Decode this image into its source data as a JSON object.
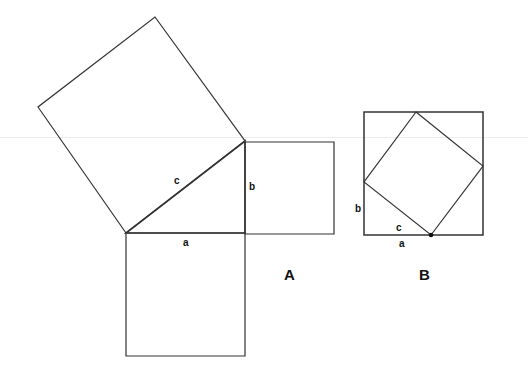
{
  "figure": {
    "panels": [
      {
        "id": "A",
        "label": "A",
        "triangle": {
          "vertices": [
            [
              126,
              233
            ],
            [
              245,
              233
            ],
            [
              245,
              141
            ]
          ]
        },
        "square_c": {
          "vertices": [
            [
              126,
              233
            ],
            [
              38,
              107
            ],
            [
              155,
              17
            ],
            [
              245,
              141
            ]
          ]
        },
        "square_b": {
          "vertices": [
            [
              245,
              142
            ],
            [
              334,
              142
            ],
            [
              334,
              234
            ],
            [
              245,
              234
            ]
          ]
        },
        "square_a": {
          "vertices": [
            [
              126,
              233
            ],
            [
              245,
              233
            ],
            [
              245,
              356
            ],
            [
              126,
              356
            ]
          ]
        },
        "side_labels": {
          "a": "a",
          "b": "b",
          "c": "c"
        }
      },
      {
        "id": "B",
        "label": "B",
        "outer_square": {
          "vertices": [
            [
              364,
              112
            ],
            [
              483,
              112
            ],
            [
              483,
              235
            ],
            [
              364,
              235
            ]
          ]
        },
        "inner_square": {
          "vertices": [
            [
              416,
              112
            ],
            [
              483,
              166
            ],
            [
              431,
              235
            ],
            [
              364,
              182
            ]
          ]
        },
        "dot": [
          431,
          235
        ],
        "side_labels": {
          "a": "a",
          "b": "b",
          "c": "c"
        }
      }
    ]
  },
  "colors": {
    "stroke": "#333333",
    "background": "#ffffff",
    "rule": "#ececec"
  }
}
